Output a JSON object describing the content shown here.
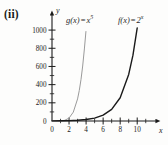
{
  "figure": {
    "panel_label": "(ii)",
    "background": "#fdfdfc"
  },
  "axes": {
    "x_axis_name": "x",
    "y_axis_name": "y",
    "origin_label": "0"
  },
  "labels": {
    "g": {
      "name": "g(x)",
      "equals": "=",
      "base": "x",
      "exponent": "5"
    },
    "f": {
      "name": "f(x)",
      "equals": "=",
      "base": "2",
      "exponent": "x"
    }
  },
  "chart_data": {
    "type": "line",
    "title": "",
    "xlabel": "x",
    "ylabel": "y",
    "xlim": [
      0,
      11.5
    ],
    "ylim": [
      0,
      1100
    ],
    "grid": false,
    "legend": "inline-curve-labels",
    "x_ticks_major": [
      0,
      2,
      4,
      6,
      8,
      10
    ],
    "x_ticks_minor": [
      1,
      3,
      5,
      7,
      9,
      11
    ],
    "x_ticklabels": [
      "0",
      "2",
      "4",
      "6",
      "8",
      "10"
    ],
    "y_ticks_major": [
      0,
      200,
      400,
      600,
      800,
      1000
    ],
    "y_ticks_minor": [
      100,
      300,
      500,
      700,
      900
    ],
    "y_ticklabels": [
      "0",
      "200",
      "400",
      "600",
      "800",
      "1000"
    ],
    "series": [
      {
        "name": "g(x) = x^5",
        "color": "#9a9a9a",
        "linewidth": 1.0,
        "x": [
          0,
          0.5,
          1,
          1.5,
          2,
          2.5,
          3,
          3.2,
          3.4,
          3.6,
          3.8,
          3.98
        ],
        "values": [
          0,
          0.03,
          1,
          7.6,
          32,
          97.7,
          243,
          335.5,
          454.4,
          604.7,
          792.4,
          984.1
        ]
      },
      {
        "name": "f(x) = 2^x",
        "color": "#1a1a1a",
        "linewidth": 1.4,
        "x": [
          0,
          1,
          2,
          3,
          4,
          5,
          6,
          7,
          8,
          9,
          9.5,
          10
        ],
        "values": [
          1,
          2,
          4,
          8,
          16,
          32,
          64,
          128,
          256,
          512,
          724,
          1024
        ]
      }
    ]
  }
}
